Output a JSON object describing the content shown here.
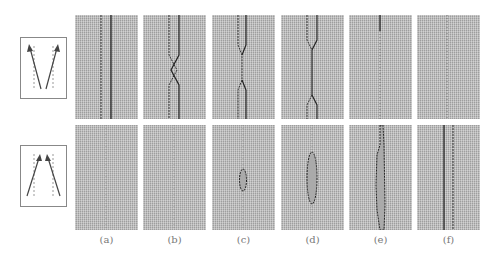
{
  "figure": {
    "rows": [
      {
        "name": "diverging",
        "icon": "diverging-arrows-icon"
      },
      {
        "name": "converging",
        "icon": "converging-arrows-icon"
      }
    ],
    "columns": [
      {
        "label": "(a)"
      },
      {
        "label": "(b)"
      },
      {
        "label": "(c)"
      },
      {
        "label": "(d)"
      },
      {
        "label": "(e)"
      },
      {
        "label": "(f)"
      }
    ],
    "colors": {
      "background": "#ffffff",
      "panel": "#b8b8b8",
      "line": "#333333",
      "box_border": "#888888"
    }
  }
}
